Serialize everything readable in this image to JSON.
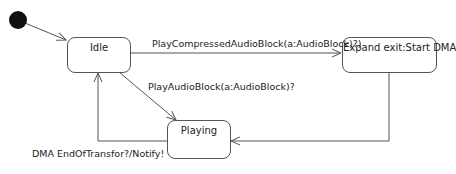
{
  "diagram": {
    "type": "state-machine",
    "initial": {
      "name": "initial-state"
    },
    "states": [
      {
        "id": "idle",
        "label": "Idle"
      },
      {
        "id": "expand",
        "label": "Expand exit:Start DMA"
      },
      {
        "id": "playing",
        "label": "Playing"
      }
    ],
    "transitions": [
      {
        "from": "initial",
        "to": "idle",
        "label": ""
      },
      {
        "from": "idle",
        "to": "expand",
        "label": "PlayCompressedAudioBlock(a:AudioBlock)?)"
      },
      {
        "from": "idle",
        "to": "playing",
        "label": "PlayAudioBlock(a:AudioBlock)?"
      },
      {
        "from": "expand",
        "to": "playing",
        "label": ""
      },
      {
        "from": "playing",
        "to": "idle",
        "label": "DMA EndOfTransfor?/Notify!"
      }
    ],
    "colors": {
      "line": "#555555",
      "initial_fill": "#111111",
      "background": "#ffffff"
    }
  }
}
